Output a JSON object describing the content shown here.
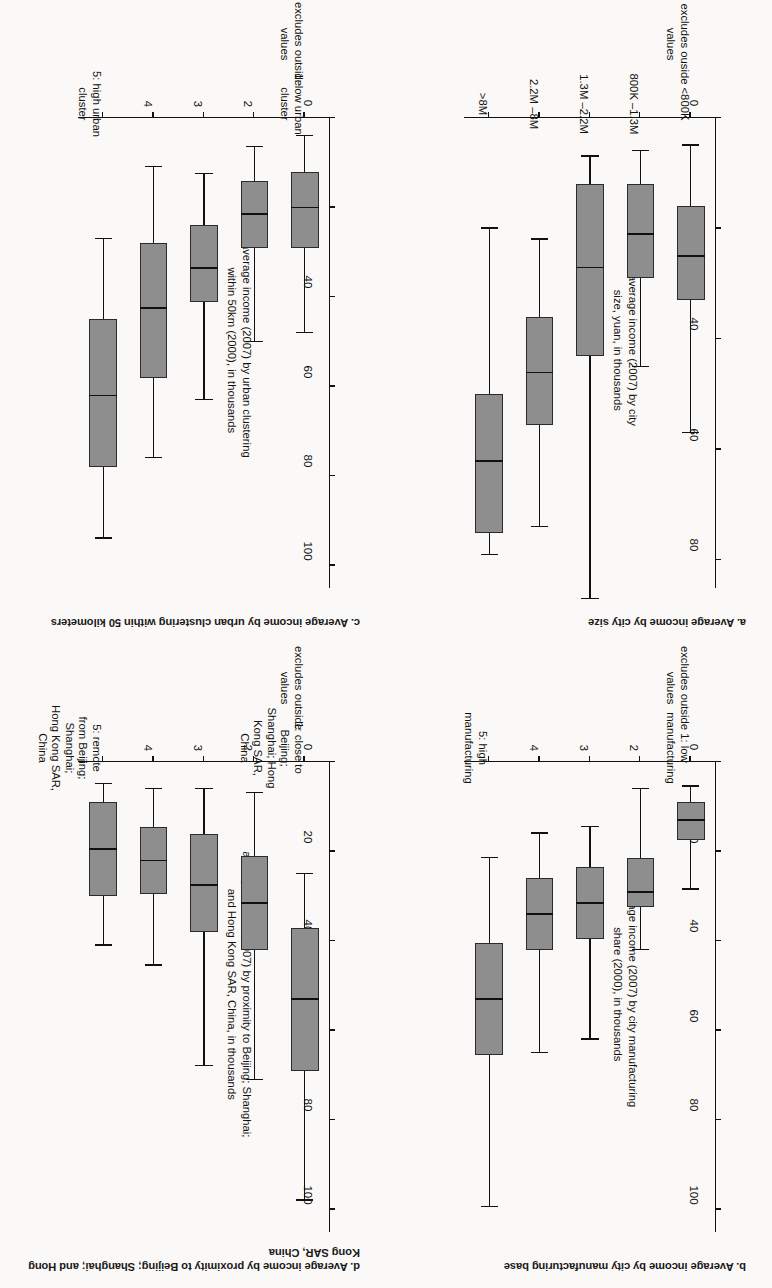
{
  "figure": {
    "background_color": "#faf9f7",
    "box_fill_color": "#8e8e8e",
    "line_color": "#111111",
    "rotation_note": "scanned page is printed upside down (180 degrees)"
  },
  "panels": [
    {
      "id": "a",
      "title": "a. Average income by city size",
      "y_axis_title": "average income (2007) by city\nsize, yuan, in thousands",
      "x_axis_note": "excludes ouside values",
      "y_ticks": [
        "0",
        "20",
        "40",
        "60",
        "80"
      ],
      "categories": [
        "<800K",
        "800K –1.3M",
        "1.3M –2.2M",
        "2.2M –8M",
        ">8M"
      ]
    },
    {
      "id": "b",
      "title": "b. Average income by city manufacturing base",
      "y_axis_title": "average income (2007) by city manufacturing\nshare (2000), in thousands",
      "x_axis_note": "excludes outside values",
      "y_ticks": [
        "0",
        "20",
        "40",
        "60",
        "80",
        "100"
      ],
      "categories": [
        "1: low manufacturing",
        "2",
        "3",
        "4",
        "5: high manufacturing"
      ]
    },
    {
      "id": "c",
      "title": "c. Average income by urban clustering within 50 kilometers",
      "y_axis_title": "average income (2007) by urban clustering\nwithin 50km (2000), in thousands",
      "x_axis_note": "excludes outside\nvalues",
      "y_ticks": [
        "0",
        "20",
        "40",
        "60",
        "80",
        "100"
      ],
      "categories": [
        "1: low urban cluster",
        "2",
        "3",
        "4",
        "5: high urban\ncluster"
      ]
    },
    {
      "id": "d",
      "title": "d. Average income by proximity to Beijing; Shanghai; and\n    Hong Kong SAR, China",
      "y_axis_title": "average income (2007) by proximity to Beijing; Shanghai;\nand Hong Kong SAR, China, in thousands",
      "x_axis_note": "excludes outside values",
      "y_ticks": [
        "0",
        "20",
        "40",
        "60",
        "80",
        "100"
      ],
      "categories": [
        "1: close to Beijing;\nShanghai; Hong Kong SAR,\nChina",
        "2",
        "3",
        "4",
        "5: remote\nfrom Beijing; Shanghai;\nHong Kong SAR, China"
      ]
    }
  ],
  "chart_data": [
    {
      "type": "box",
      "panel": "a",
      "title": "a. Average income by city size",
      "xlabel": "city size (excludes ouside values)",
      "ylabel": "average income (2007) by city size, yuan, in thousands",
      "ylim": [
        0,
        85
      ],
      "yticks": [
        0,
        20,
        40,
        60,
        80
      ],
      "grid": false,
      "categories": [
        "<800K",
        "800K –1.3M",
        "1.3M –2.2M",
        "2.2M –8M",
        ">8M"
      ],
      "boxes": [
        {
          "category": "<800K",
          "whisker_low": 5,
          "q1": 16,
          "median": 25,
          "q3": 33,
          "whisker_high": 57
        },
        {
          "category": "800K –1.3M",
          "whisker_low": 6,
          "q1": 12,
          "median": 21,
          "q3": 29,
          "whisker_high": 45
        },
        {
          "category": "1.3M –2.2M",
          "whisker_low": 7,
          "q1": 12,
          "median": 27,
          "q3": 43,
          "whisker_high": 87
        },
        {
          "category": "2.2M –8M",
          "whisker_low": 22,
          "q1": 36,
          "median": 46,
          "q3": 55.5,
          "whisker_high": 74
        },
        {
          "category": ">8M",
          "whisker_low": 20,
          "q1": 50,
          "median": 62,
          "q3": 75,
          "whisker_high": 79
        }
      ]
    },
    {
      "type": "box",
      "panel": "b",
      "title": "b. Average income by city manufacturing base",
      "xlabel": "city manufacturing share (2000) (excludes outside values)",
      "ylabel": "average income (2007) by city manufacturing share (2000), in thousands",
      "ylim": [
        0,
        105
      ],
      "yticks": [
        0,
        20,
        40,
        60,
        80,
        100
      ],
      "grid": false,
      "categories": [
        "1: low manufacturing",
        "2",
        "3",
        "4",
        "5: high manufacturing"
      ],
      "boxes": [
        {
          "category": "1: low manufacturing",
          "whisker_low": 5.5,
          "q1": 9,
          "median": 13,
          "q3": 17.5,
          "whisker_high": 28.5
        },
        {
          "category": "2",
          "whisker_low": 6,
          "q1": 21.5,
          "median": 29,
          "q3": 32.5,
          "whisker_high": 42
        },
        {
          "category": "3",
          "whisker_low": 14.5,
          "q1": 23.5,
          "median": 31.5,
          "q3": 39.5,
          "whisker_high": 62
        },
        {
          "category": "4",
          "whisker_low": 16,
          "q1": 26,
          "median": 34,
          "q3": 42,
          "whisker_high": 65
        },
        {
          "category": "5: high manufacturing",
          "whisker_low": 21.5,
          "q1": 40.5,
          "median": 53,
          "q3": 65.5,
          "whisker_high": 99.5
        }
      ]
    },
    {
      "type": "box",
      "panel": "c",
      "title": "c. Average income by urban clustering within 50 kilometers",
      "xlabel": "urban clustering within 50km (2000) (excludes outside values)",
      "ylabel": "average income (2007) by urban clustering within 50km (2000), in thousands",
      "ylim": [
        0,
        105
      ],
      "yticks": [
        0,
        20,
        40,
        60,
        80,
        100
      ],
      "grid": false,
      "categories": [
        "1: low urban cluster",
        "2",
        "3",
        "4",
        "5: high urban cluster"
      ],
      "boxes": [
        {
          "category": "1: low urban cluster",
          "whisker_low": 4,
          "q1": 12,
          "median": 20,
          "q3": 29,
          "whisker_high": 48
        },
        {
          "category": "2",
          "whisker_low": 6.5,
          "q1": 14,
          "median": 21.5,
          "q3": 29,
          "whisker_high": 50
        },
        {
          "category": "3",
          "whisker_low": 12.5,
          "q1": 24,
          "median": 33.5,
          "q3": 41,
          "whisker_high": 63
        },
        {
          "category": "4",
          "whisker_low": 11,
          "q1": 28,
          "median": 42.5,
          "q3": 58,
          "whisker_high": 76
        },
        {
          "category": "5: high urban cluster",
          "whisker_low": 27,
          "q1": 45,
          "median": 62,
          "q3": 78,
          "whisker_high": 94
        }
      ]
    },
    {
      "type": "box",
      "panel": "d",
      "title": "d. Average income by proximity to Beijing; Shanghai; and Hong Kong SAR, China",
      "xlabel": "proximity to Beijing; Shanghai; Hong Kong SAR, China (excludes outside values)",
      "ylabel": "average income (2007) by proximity to Beijing; Shanghai; and Hong Kong SAR, China, in thousands",
      "ylim": [
        0,
        105
      ],
      "yticks": [
        0,
        20,
        40,
        60,
        80,
        100
      ],
      "grid": false,
      "categories": [
        "1: close to Beijing; Shanghai; Hong Kong SAR, China",
        "2",
        "3",
        "4",
        "5: remote from Beijing; Shanghai; Hong Kong SAR, China"
      ],
      "boxes": [
        {
          "category": "1: close to Beijing; Shanghai; Hong Kong SAR, China",
          "whisker_low": 25,
          "q1": 37,
          "median": 53,
          "q3": 69,
          "whisker_high": 98
        },
        {
          "category": "2",
          "whisker_low": 7,
          "q1": 21,
          "median": 31.5,
          "q3": 42,
          "whisker_high": 71
        },
        {
          "category": "3",
          "whisker_low": 6,
          "q1": 16,
          "median": 27.5,
          "q3": 38,
          "whisker_high": 68
        },
        {
          "category": "4",
          "whisker_low": 6,
          "q1": 14.5,
          "median": 22,
          "q3": 29.5,
          "whisker_high": 45.5
        },
        {
          "category": "5: remote from Beijing; Shanghai; Hong Kong SAR, China",
          "whisker_low": 5,
          "q1": 9,
          "median": 19.5,
          "q3": 30,
          "whisker_high": 41
        }
      ]
    }
  ]
}
